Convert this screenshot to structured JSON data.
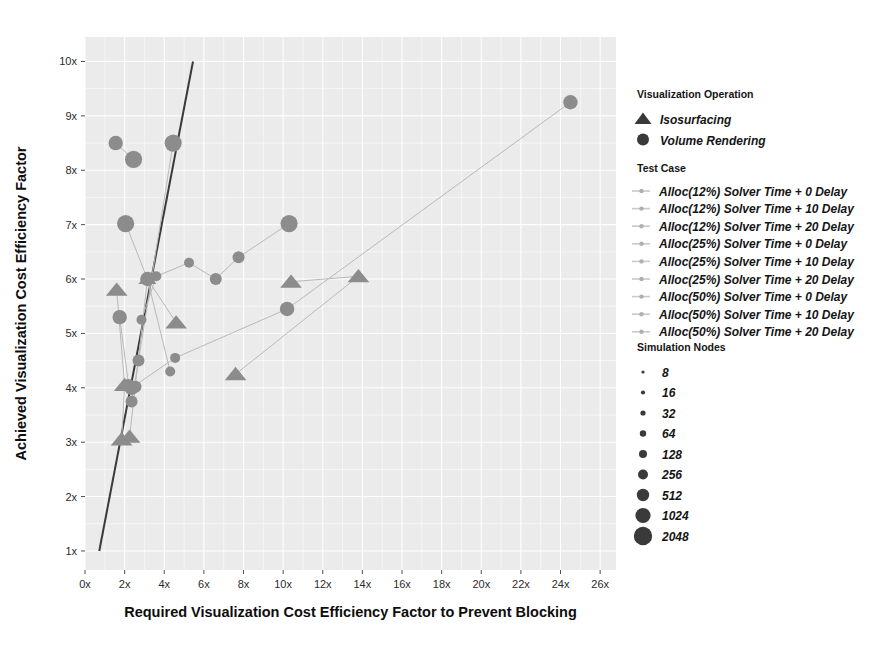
{
  "chart_data": {
    "type": "scatter",
    "title": "",
    "xlabel": "Required Visualization Cost Efficiency Factor to Prevent Blocking",
    "ylabel": "Achieved Visualization Cost Efficiency Factor",
    "xlim": [
      0,
      26.8
    ],
    "ylim": [
      0.65,
      10.45
    ],
    "xticks": [
      "0x",
      "2x",
      "4x",
      "6x",
      "8x",
      "10x",
      "12x",
      "14x",
      "16x",
      "18x",
      "20x",
      "22x",
      "24x",
      "26x"
    ],
    "xtick_values": [
      0,
      2,
      4,
      6,
      8,
      10,
      12,
      14,
      16,
      18,
      20,
      22,
      24,
      26
    ],
    "yticks": [
      "1x",
      "2x",
      "3x",
      "4x",
      "5x",
      "6x",
      "7x",
      "8x",
      "9x",
      "10x"
    ],
    "ytick_values": [
      1,
      2,
      3,
      4,
      5,
      6,
      7,
      8,
      9,
      10
    ],
    "grid": true,
    "legend_position": "right",
    "reference_line": {
      "label": "",
      "points": [
        [
          0.72,
          1.0
        ],
        [
          5.45,
          10.0
        ]
      ]
    },
    "series": [
      {
        "name": "Alloc(12%) Solver Time + 0 Delay",
        "operation": "Volume Rendering",
        "points": [
          {
            "x": 1.55,
            "y": 8.5,
            "nodes": 512
          },
          {
            "x": 2.45,
            "y": 8.2,
            "nodes": 1024
          }
        ]
      },
      {
        "name": "Alloc(12%) Solver Time + 10 Delay",
        "operation": "Volume Rendering",
        "points": [
          {
            "x": 2.05,
            "y": 7.02,
            "nodes": 1024
          },
          {
            "x": 3.15,
            "y": 6.0,
            "nodes": 512
          },
          {
            "x": 4.3,
            "y": 4.3,
            "nodes": 128
          }
        ]
      },
      {
        "name": "Alloc(12%) Solver Time + 20 Delay",
        "operation": "Volume Rendering",
        "points": [
          {
            "x": 1.75,
            "y": 5.3,
            "nodes": 512
          },
          {
            "x": 2.2,
            "y": 4.05,
            "nodes": 256
          },
          {
            "x": 2.55,
            "y": 4.02,
            "nodes": 256
          }
        ]
      },
      {
        "name": "Alloc(25%) Solver Time + 0 Delay",
        "operation": "Volume Rendering",
        "points": [
          {
            "x": 4.45,
            "y": 8.5,
            "nodes": 1024
          },
          {
            "x": 2.7,
            "y": 4.5,
            "nodes": 256
          },
          {
            "x": 2.35,
            "y": 3.75,
            "nodes": 256
          }
        ]
      },
      {
        "name": "Alloc(25%) Solver Time + 10 Delay",
        "operation": "Volume Rendering",
        "points": [
          {
            "x": 10.3,
            "y": 7.02,
            "nodes": 1024
          },
          {
            "x": 7.75,
            "y": 6.4,
            "nodes": 256
          },
          {
            "x": 6.6,
            "y": 6.0,
            "nodes": 256
          },
          {
            "x": 5.25,
            "y": 6.3,
            "nodes": 128
          },
          {
            "x": 3.6,
            "y": 6.05,
            "nodes": 128
          },
          {
            "x": 2.85,
            "y": 5.25,
            "nodes": 128
          }
        ]
      },
      {
        "name": "Alloc(25%) Solver Time + 20 Delay",
        "operation": "Volume Rendering",
        "points": [
          {
            "x": 24.5,
            "y": 9.25,
            "nodes": 512
          },
          {
            "x": 10.2,
            "y": 5.45,
            "nodes": 512
          },
          {
            "x": 4.55,
            "y": 4.55,
            "nodes": 128
          },
          {
            "x": 2.35,
            "y": 4.0,
            "nodes": 512
          }
        ]
      },
      {
        "name": "Alloc(50%) Solver Time + 0 Delay",
        "operation": "Isosurfacing",
        "points": [
          {
            "x": 1.6,
            "y": 5.8,
            "nodes": 512
          },
          {
            "x": 2.0,
            "y": 4.05,
            "nodes": 512
          },
          {
            "x": 1.85,
            "y": 3.05,
            "nodes": 512
          }
        ]
      },
      {
        "name": "Alloc(50%) Solver Time + 10 Delay",
        "operation": "Isosurfacing",
        "points": [
          {
            "x": 4.6,
            "y": 5.2,
            "nodes": 512
          },
          {
            "x": 3.15,
            "y": 6.0,
            "nodes": 256
          },
          {
            "x": 2.25,
            "y": 3.1,
            "nodes": 512
          }
        ]
      },
      {
        "name": "Alloc(50%) Solver Time + 20 Delay",
        "operation": "Isosurfacing",
        "points": [
          {
            "x": 10.4,
            "y": 5.95,
            "nodes": 512
          },
          {
            "x": 13.8,
            "y": 6.05,
            "nodes": 512
          },
          {
            "x": 7.6,
            "y": 4.25,
            "nodes": 512
          }
        ]
      }
    ]
  },
  "axes": {
    "x_title": "Required Visualization Cost Efficiency Factor to Prevent Blocking",
    "y_title": "Achieved Visualization Cost Efficiency Factor"
  },
  "legends": {
    "operation": {
      "heading": "Visualization Operation",
      "items": [
        {
          "label": "Isosurfacing",
          "glyph": "triangle-icon"
        },
        {
          "label": "Volume Rendering",
          "glyph": "circle-icon"
        }
      ]
    },
    "test_case": {
      "heading": "Test Case",
      "items": [
        {
          "label": "Alloc(12%)  Solver Time + 0 Delay"
        },
        {
          "label": "Alloc(12%)  Solver Time + 10 Delay"
        },
        {
          "label": "Alloc(12%)  Solver Time + 20 Delay"
        },
        {
          "label": "Alloc(25%)  Solver Time + 0 Delay"
        },
        {
          "label": "Alloc(25%)  Solver Time + 10 Delay"
        },
        {
          "label": "Alloc(25%)  Solver Time + 20 Delay"
        },
        {
          "label": "Alloc(50%)  Solver Time + 0 Delay"
        },
        {
          "label": "Alloc(50%)  Solver Time + 10 Delay"
        },
        {
          "label": "Alloc(50%)  Solver Time + 20 Delay"
        }
      ]
    },
    "sim_nodes": {
      "heading": "Simulation Nodes",
      "items": [
        {
          "label": "8",
          "r": 1.6
        },
        {
          "label": "16",
          "r": 2.1
        },
        {
          "label": "32",
          "r": 2.6
        },
        {
          "label": "64",
          "r": 3.2
        },
        {
          "label": "128",
          "r": 4.0
        },
        {
          "label": "256",
          "r": 5.0
        },
        {
          "label": "512",
          "r": 6.2
        },
        {
          "label": "1024",
          "r": 7.6
        },
        {
          "label": "2048",
          "r": 9.2
        }
      ]
    }
  },
  "colors": {
    "panel": "#ebebeb",
    "grid": "#ffffff",
    "point": "#8c8c8c",
    "refline": "#3a3a3a",
    "text": "#151515"
  }
}
